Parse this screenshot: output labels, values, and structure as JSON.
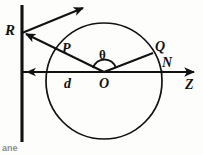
{
  "figure": {
    "type": "optics-geometry-diagram",
    "background_color": "#fdfdfc",
    "stroke_color": "#111111",
    "labels": {
      "mirror_source": "R",
      "circle_point_upper_left": "P",
      "circle_point_upper_right": "Q",
      "axis_intersection": "N",
      "center": "O",
      "axis": "Z",
      "distance": "d",
      "angle": "θ"
    },
    "geometry": {
      "circle": {
        "cx": 104,
        "cy": 81,
        "r": 58
      },
      "center_point": {
        "x": 104,
        "y": 72
      },
      "mirror_line": {
        "x": 22,
        "y1": 5,
        "y2": 142
      },
      "axis_line": {
        "x1": 22,
        "y1": 72,
        "x2": 198,
        "y2": 72
      },
      "vertex_on_mirror": {
        "x": 22,
        "y": 33
      },
      "point_P": {
        "x": 62,
        "y": 50
      },
      "point_Q": {
        "x": 152,
        "y": 53
      },
      "point_N": {
        "x": 162,
        "y": 72
      },
      "dashed_line": {
        "x1": 24,
        "y1": 72,
        "x2": 102,
        "y2": 72
      }
    },
    "caption_remnant": "ane"
  }
}
